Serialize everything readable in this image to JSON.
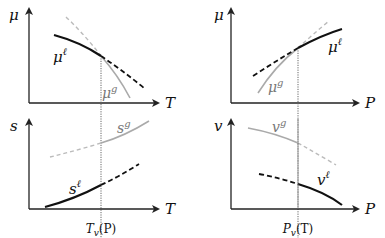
{
  "panels": {
    "top_left": {
      "y_axis_label": "μ",
      "x_axis_label": "T",
      "liquid_label": "μ",
      "liquid_sup": "ℓ",
      "gas_label": "μ",
      "gas_sup": "g"
    },
    "top_right": {
      "y_axis_label": "μ",
      "x_axis_label": "P",
      "liquid_label": "μ",
      "liquid_sup": "ℓ",
      "gas_label": "μ",
      "gas_sup": "g"
    },
    "bottom_left": {
      "y_axis_label": "s",
      "x_axis_label": "T",
      "liquid_label": "s",
      "liquid_sup": "ℓ",
      "gas_label": "s",
      "gas_sup": "g",
      "tick_label": "T",
      "tick_sub": "v",
      "tick_arg": "(P)"
    },
    "bottom_right": {
      "y_axis_label": "v",
      "x_axis_label": "P",
      "liquid_label": "v",
      "liquid_sup": "ℓ",
      "gas_label": "v",
      "gas_sup": "g",
      "tick_label": "P",
      "tick_sub": "v",
      "tick_arg": "(T)"
    }
  },
  "colors": {
    "liquid": "#111111",
    "gas": "#aaaaaa",
    "axis": "#222222",
    "guide": "#555555"
  }
}
